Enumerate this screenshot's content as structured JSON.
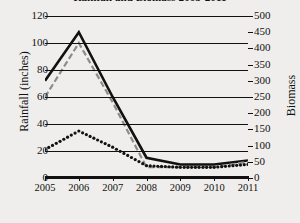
{
  "chart_data": {
    "type": "line",
    "title": "Rainfall and Biomass 2005-2011",
    "xlabel": "",
    "ylabel": "Rainfall (inches)",
    "y2label": "Biomass",
    "x": [
      2005,
      2006,
      2007,
      2008,
      2009,
      2010,
      2011
    ],
    "xticklabels": [
      "2005",
      "2006",
      "2007",
      "2008",
      "2009",
      "2010",
      "2011"
    ],
    "ylim": [
      0,
      120
    ],
    "yticks": [
      0,
      20,
      40,
      60,
      80,
      100,
      120
    ],
    "yticklabels": [
      "0",
      "20",
      "40",
      "60",
      "80",
      "100",
      "120"
    ],
    "y2lim": [
      0,
      500
    ],
    "y2ticks": [
      0,
      50,
      100,
      150,
      200,
      250,
      300,
      350,
      400,
      450,
      500
    ],
    "y2ticklabels": [
      "0",
      "50",
      "100",
      "150",
      "200",
      "250",
      "300",
      "350",
      "400",
      "450",
      "500"
    ],
    "grid": true,
    "legend": "none",
    "series": [
      {
        "name": "rainfall-solid",
        "axis": "left",
        "style": "solid",
        "color": "#111111",
        "values": [
          72,
          108,
          60,
          15,
          10,
          10,
          13
        ]
      },
      {
        "name": "rainfall-dashed",
        "axis": "left",
        "style": "dashed",
        "color": "#8c8c8c",
        "values": [
          60,
          100,
          56,
          8,
          8,
          8,
          12
        ]
      },
      {
        "name": "biomass-dotted",
        "axis": "right",
        "style": "dotted",
        "color": "#111111",
        "values": [
          88,
          145,
          95,
          38,
          33,
          33,
          42
        ]
      }
    ]
  }
}
